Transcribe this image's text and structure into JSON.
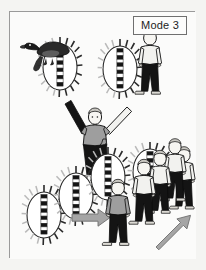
{
  "figure": {
    "label": "Mode 3",
    "domain_kind": "diagram",
    "palette": {
      "page_background": "#f2f2f0",
      "panel_background": "#fbfbfa",
      "panel_border": "#9a9a9a",
      "ink": "#1d1d1d",
      "shirt_light": "#f2f2ef",
      "shirt_gray": "#9e9e9e",
      "trousers_dark": "#141414",
      "arrow_gray": "#a5a5a5",
      "arrow_gray_edge": "#6e6e6e",
      "duck_dark": "#2a2a2a",
      "tick_light": "#b9b9b9"
    },
    "scene_elements": [
      {
        "name": "duck-on-oval",
        "kind": "bird-perched-on-spiked-oval",
        "x": 18,
        "y": 20,
        "w": 62,
        "h": 66
      },
      {
        "name": "person-beside-oval",
        "kind": "standing-person-white-shirt",
        "x": 92,
        "y": 22,
        "w": 58,
        "h": 70
      },
      {
        "name": "central-person",
        "kind": "person-arms-raised",
        "x": 58,
        "y": 86,
        "w": 60,
        "h": 78
      },
      {
        "name": "oval-cluster",
        "kind": "three-overlapping-ovals",
        "x": 16,
        "y": 148,
        "w": 96,
        "h": 88
      },
      {
        "name": "gray-person",
        "kind": "standing-person-gray-shirt",
        "x": 104,
        "y": 172,
        "w": 36,
        "h": 62
      },
      {
        "name": "crowd-group",
        "kind": "four-standing-people",
        "x": 132,
        "y": 128,
        "w": 66,
        "h": 104
      },
      {
        "name": "horizontal-arrow",
        "kind": "arrow-right",
        "x": 70,
        "y": 200,
        "w": 42,
        "h": 14
      },
      {
        "name": "diagonal-arrow",
        "kind": "arrow-up-right",
        "x": 152,
        "y": 198,
        "w": 44,
        "h": 46
      }
    ],
    "oval_markers": {
      "description": "sun-like ovals with radiating tick marks and an inner vertical column of alternating black and white squares",
      "tick_count_each": 18,
      "inner_cells": 11
    }
  }
}
